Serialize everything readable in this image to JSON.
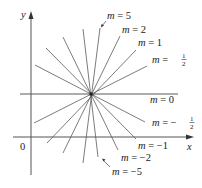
{
  "figure": {
    "axes": {
      "x_label": "x",
      "y_label": "y",
      "origin_label": "0",
      "color": "#555555"
    },
    "center_point": {
      "x": 91,
      "y": 94
    },
    "line_color": "#5a5a5a",
    "lines": [
      {
        "slope_label": "5",
        "x1": 83,
        "y1": 163,
        "x2": 100,
        "y2": 28
      },
      {
        "slope_label": "2",
        "x1": 63,
        "y1": 153,
        "x2": 120,
        "y2": 36
      },
      {
        "slope_label": "1",
        "x1": 47,
        "y1": 143,
        "x2": 136,
        "y2": 50
      },
      {
        "slope_label": "1/2",
        "x1": 34,
        "y1": 123,
        "x2": 147,
        "y2": 66
      },
      {
        "slope_label": "0",
        "x1": 20,
        "y1": 94,
        "x2": 178,
        "y2": 94
      },
      {
        "slope_label": "-1/2",
        "x1": 35,
        "y1": 65,
        "x2": 145,
        "y2": 122
      },
      {
        "slope_label": "-1",
        "x1": 46,
        "y1": 48,
        "x2": 136,
        "y2": 139
      },
      {
        "slope_label": "-2",
        "x1": 63,
        "y1": 37,
        "x2": 118,
        "y2": 150
      },
      {
        "slope_label": "-5",
        "x1": 83,
        "y1": 29,
        "x2": 98,
        "y2": 157
      }
    ],
    "labels": [
      {
        "m": "m",
        "eq": " = ",
        "val": "5",
        "x": 107,
        "y": 19
      },
      {
        "m": "m",
        "eq": " = ",
        "val": "2",
        "x": 122,
        "y": 33
      },
      {
        "m": "m",
        "eq": " = ",
        "val": "1",
        "x": 138,
        "y": 46
      },
      {
        "m": "m",
        "eq": " = ",
        "num": "1",
        "den": "2",
        "sign": "",
        "x": 152,
        "y": 63
      },
      {
        "m": "m",
        "eq": " = ",
        "val": "0",
        "x": 150,
        "y": 103
      },
      {
        "m": "m",
        "eq": " = ",
        "num": "1",
        "den": "2",
        "sign": "−",
        "x": 152,
        "y": 126
      },
      {
        "m": "m",
        "eq": " = ",
        "val": "−1",
        "x": 138,
        "y": 149
      },
      {
        "m": "m",
        "eq": " = ",
        "val": "−2",
        "x": 121,
        "y": 161
      },
      {
        "m": "m",
        "eq": " = ",
        "val": "−5",
        "x": 112,
        "y": 175
      }
    ]
  }
}
